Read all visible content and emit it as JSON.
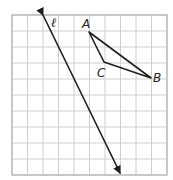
{
  "diagram": {
    "type": "coordinate-grid-geometry",
    "grid": {
      "columns": 10,
      "rows": 10,
      "origin_px": [
        12,
        15
      ],
      "cell_w": 15.5,
      "cell_h": 16,
      "line_color": "#c8c8c8"
    },
    "line": {
      "label": "ℓ",
      "from_px": [
        43,
        15
      ],
      "to_px": [
        120,
        173
      ],
      "arrows": "both",
      "color": "#1e1e1e"
    },
    "triangle": {
      "vertices": [
        {
          "label": "A",
          "px": [
            89,
            32
          ]
        },
        {
          "label": "B",
          "px": [
            151,
            78
          ]
        },
        {
          "label": "C",
          "px": [
            104,
            62
          ]
        }
      ],
      "color": "#1e1e1e"
    },
    "labels": {
      "line_l": "ℓ",
      "A": "A",
      "B": "B",
      "C": "C"
    }
  }
}
